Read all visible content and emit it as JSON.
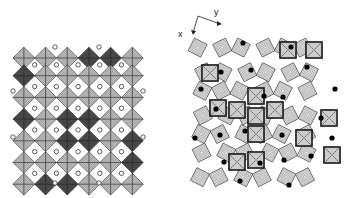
{
  "figure": {
    "left_panel": {
      "description": "Ordered octahedral framework viewed down c",
      "grid_cols": 6,
      "grid_rows": 6,
      "origin": [
        13,
        48
      ],
      "cell": 21.7,
      "open_cation_marker": "open-circle",
      "dark_cells": [
        [
          3,
          0
        ],
        [
          4,
          0
        ],
        [
          0,
          1
        ],
        [
          0,
          3
        ],
        [
          2,
          3
        ],
        [
          3,
          3
        ],
        [
          3,
          4
        ],
        [
          2,
          4
        ],
        [
          5,
          4
        ],
        [
          5,
          5
        ],
        [
          1,
          6
        ],
        [
          2,
          6
        ]
      ]
    },
    "right_panel": {
      "description": "Distorted framework with tetrahedral/square units",
      "axes": {
        "x_label": "x",
        "y_label": "y"
      },
      "filled_cation_marker": "filled-circle"
    },
    "colors": {
      "line": "#222222",
      "shade_light": "#bdbdbd",
      "shade_dark": "#555555",
      "background": "#ffffff"
    }
  }
}
